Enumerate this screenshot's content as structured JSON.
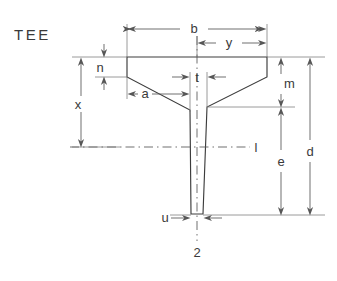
{
  "figure": {
    "title": "TEE",
    "type": "engineering-cross-section-drawing",
    "section_label": "2",
    "axis_label": "l"
  },
  "dimensions": {
    "b": {
      "label": "b",
      "meaning": "overall flange width"
    },
    "y": {
      "label": "y",
      "meaning": "distance from web centerline to flange edge"
    },
    "n": {
      "label": "n",
      "meaning": "flange edge thickness"
    },
    "a": {
      "label": "a",
      "meaning": "flange taper horizontal run"
    },
    "t": {
      "label": "t",
      "meaning": "web thickness at top"
    },
    "m": {
      "label": "m",
      "meaning": "depth from flange top to fillet"
    },
    "x": {
      "label": "x",
      "meaning": "distance from flange top to axis l"
    },
    "d": {
      "label": "d",
      "meaning": "overall depth"
    },
    "e": {
      "label": "e",
      "meaning": "depth from fillet to bottom of stem"
    },
    "u": {
      "label": "u",
      "meaning": "stem thickness at bottom"
    }
  },
  "labels": [
    {
      "name": "title",
      "text": "TEE",
      "x": 14,
      "y": 40,
      "class": "lbl-title"
    },
    {
      "name": "b",
      "text": "b",
      "x": 194,
      "y": 27,
      "class": "lbl"
    },
    {
      "name": "y",
      "text": "y",
      "x": 229,
      "y": 43,
      "class": "lbl"
    },
    {
      "name": "n",
      "text": "n",
      "x": 100,
      "y": 72,
      "class": "lbl"
    },
    {
      "name": "t",
      "text": "t",
      "x": 195,
      "y": 82,
      "class": "lbl"
    },
    {
      "name": "a",
      "text": "a",
      "x": 140,
      "y": 100,
      "class": "lbl"
    },
    {
      "name": "m",
      "text": "m",
      "x": 284,
      "y": 84,
      "class": "lbl"
    },
    {
      "name": "x",
      "text": "x",
      "x": 78,
      "y": 106,
      "class": "lbl"
    },
    {
      "name": "l",
      "text": "l",
      "x": 255,
      "y": 151,
      "class": "lbl"
    },
    {
      "name": "d",
      "text": "d",
      "x": 312,
      "y": 153,
      "class": "lbl"
    },
    {
      "name": "e",
      "text": "e",
      "x": 283,
      "y": 162,
      "class": "lbl"
    },
    {
      "name": "u",
      "text": "u",
      "x": 161,
      "y": 223,
      "class": "lbl"
    },
    {
      "name": "2",
      "text": "2",
      "x": 193,
      "y": 254,
      "class": "lbl"
    }
  ],
  "colors": {
    "background": "#ffffff",
    "outline": "#3c3c3c",
    "dimension": "#565656",
    "extension": "#7a7a7a",
    "text": "#3a3a3a"
  }
}
